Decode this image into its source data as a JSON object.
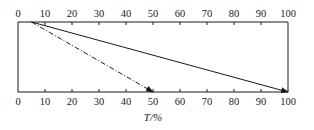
{
  "diagram": {
    "top_axis": {
      "ticks": [
        "0",
        "10",
        "20",
        "30",
        "40",
        "50",
        "60",
        "70",
        "80",
        "90",
        "100"
      ]
    },
    "bottom_axis": {
      "ticks": [
        "0",
        "10",
        "20",
        "30",
        "40",
        "50",
        "60",
        "70",
        "80",
        "90",
        "100"
      ],
      "label": "T/%"
    },
    "arrows": [
      {
        "name": "solid-arrow",
        "style": "solid",
        "from_top": 5,
        "to_bottom": 100
      },
      {
        "name": "dashed-arrow",
        "style": "dashed",
        "from_top": 5,
        "to_bottom": 50
      }
    ],
    "colors": {
      "line": "#1a1a1a",
      "background": "#ffffff"
    }
  }
}
